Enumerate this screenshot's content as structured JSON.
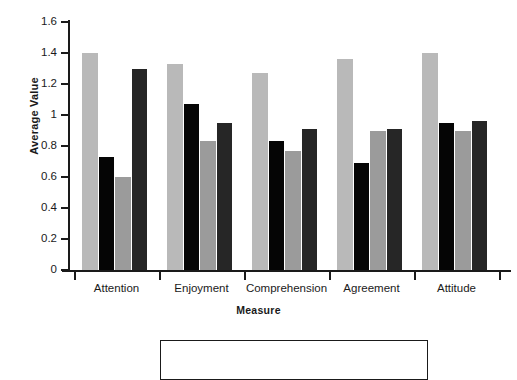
{
  "chart_data": {
    "type": "bar",
    "title": "",
    "xlabel": "Measure",
    "ylabel": "Average Value",
    "categories": [
      "Attention",
      "Enjoyment",
      "Comprehension",
      "Agreement",
      "Attitude"
    ],
    "series": [
      {
        "name": "series-1",
        "color": "#b9b9b9",
        "values": [
          1.4,
          1.33,
          1.27,
          1.36,
          1.4
        ]
      },
      {
        "name": "series-2",
        "color": "#050505",
        "values": [
          0.73,
          1.07,
          0.83,
          0.69,
          0.95
        ]
      },
      {
        "name": "series-3",
        "color": "#9b9b9b",
        "values": [
          0.6,
          0.83,
          0.77,
          0.9,
          0.9
        ]
      },
      {
        "name": "series-4",
        "color": "#262626",
        "values": [
          1.3,
          0.95,
          0.91,
          0.91,
          0.96
        ]
      }
    ],
    "ylim": [
      0,
      1.6
    ],
    "ytick_labels": [
      "0",
      "0.2",
      "0.4",
      "0.6",
      "0.8",
      "1",
      "1.2",
      "1.4",
      "1.6"
    ],
    "ytick_values": [
      0,
      0.2,
      0.4,
      0.6,
      0.8,
      1.0,
      1.2,
      1.4,
      1.6
    ],
    "grid": false,
    "legend_position": "bottom",
    "legend_entries": []
  },
  "legend": {
    "visible": true,
    "entries": []
  }
}
